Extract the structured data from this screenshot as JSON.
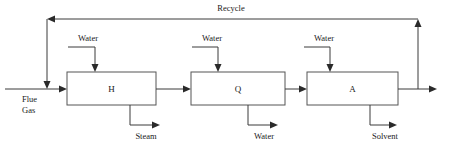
{
  "diagram": {
    "type": "process-flow-diagram",
    "canvas": {
      "width": 457,
      "height": 152
    },
    "colors": {
      "background": "#ffffff",
      "box_stroke": "#555555",
      "line_stroke": "#3a3a3a",
      "arrow_fill": "#2a2a2a",
      "text": "#1a1a1a"
    }
  },
  "units": [
    {
      "id": "unit-h",
      "label": "H",
      "x": 67,
      "y": 72,
      "width": 89,
      "height": 33,
      "inlet_top_label": "Water",
      "outlet_bottom_label": "Steam"
    },
    {
      "id": "unit-q",
      "label": "Q",
      "x": 191,
      "y": 72,
      "width": 94,
      "height": 33,
      "inlet_top_label": "Water",
      "outlet_bottom_label": "Water"
    },
    {
      "id": "unit-a",
      "label": "A",
      "x": 307,
      "y": 72,
      "width": 91,
      "height": 33,
      "inlet_top_label": "Water",
      "outlet_bottom_label": "Solvent"
    }
  ],
  "streams": {
    "feed": {
      "label_line1": "Flue",
      "label_line2": "Gas",
      "label_x": 22,
      "label_y1": 102,
      "label_y2": 113
    },
    "recycle": {
      "label": "Recycle",
      "label_x": 231,
      "label_y": 11
    },
    "water_inlets": [
      {
        "label": "Water",
        "label_x": 88,
        "label_y": 41
      },
      {
        "label": "Water",
        "label_x": 212,
        "label_y": 41
      },
      {
        "label": "Water",
        "label_x": 324,
        "label_y": 41
      }
    ],
    "bottom_outlets": [
      {
        "label": "Steam",
        "label_x": 146,
        "label_y": 139
      },
      {
        "label": "Water",
        "label_x": 264,
        "label_y": 139
      },
      {
        "label": "Solvent",
        "label_x": 385,
        "label_y": 139
      }
    ]
  },
  "geometry": {
    "main_line_y": 89,
    "recycle_line_y": 19,
    "water_stub_y": 47,
    "bottom_line_y": 125,
    "feed_start_x": 5,
    "recycle_left_x": 47,
    "recycle_right_x": 418,
    "outlet_end_x": 437
  }
}
